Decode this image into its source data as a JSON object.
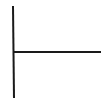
{
  "diagram": {
    "type": "line-drawing",
    "background": "#ffffff",
    "stroke_color": "#1a1a1a",
    "stroke_width": 2,
    "lines": [
      {
        "name": "vertical-line",
        "x1": 13,
        "y1": 6,
        "x2": 14,
        "y2": 98
      },
      {
        "name": "horizontal-line",
        "x1": 14,
        "y1": 52,
        "x2": 101,
        "y2": 52
      }
    ]
  }
}
